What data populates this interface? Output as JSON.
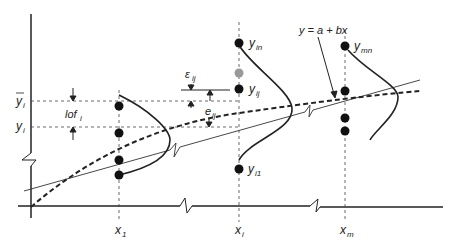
{
  "diagram": {
    "equation_label": "y = a + bx",
    "x_labels": [
      {
        "base": "x",
        "sub": "1"
      },
      {
        "base": "x",
        "sub": "i"
      },
      {
        "base": "x",
        "sub": "m"
      }
    ],
    "y_labels": {
      "ybar": {
        "base": "y",
        "sub": "i",
        "bar": true
      },
      "yhat": {
        "base": "y",
        "sub": "i"
      }
    },
    "point_labels": [
      {
        "base": "y",
        "sub": "in"
      },
      {
        "base": "y",
        "sub": "ij"
      },
      {
        "base": "y",
        "sub": "i1"
      },
      {
        "base": "y",
        "sub": "mn"
      }
    ],
    "annotations": [
      {
        "base": "lof",
        "sub": "i"
      },
      {
        "base": "ε",
        "sub": "ij"
      },
      {
        "base": "e",
        "sub": "ij"
      }
    ],
    "colors": {
      "ink": "#222222",
      "mean_point": "#999999"
    }
  }
}
